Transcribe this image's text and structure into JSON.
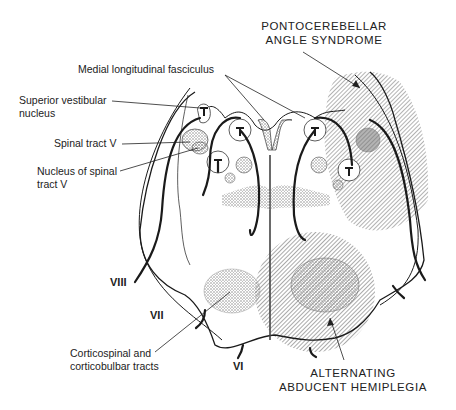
{
  "figure": {
    "type": "anatomical cross-section of lower pons",
    "syndromes": [
      {
        "label_line1": "PONTOCEREBELLAR",
        "label_line2": "ANGLE SYNDROME"
      },
      {
        "label_line1": "ALTERNATING",
        "label_line2": "ABDUCENT HEMIPLEGIA"
      }
    ],
    "structures": {
      "mlf": "Medial longitudinal fasciculus",
      "sup_vest_line1": "Superior vestibular",
      "sup_vest_line2": "nucleus",
      "spinal_tract": "Spinal tract V",
      "nuc_spinal_line1": "Nucleus of spinal",
      "nuc_spinal_line2": "tract V",
      "cortico_line1": "Corticospinal and",
      "cortico_line2": "corticobulbar tracts"
    },
    "nerves": {
      "n8": "VIII",
      "n7": "VII",
      "n6": "VI"
    },
    "colors": {
      "ink": "#1a1a1a",
      "hatch": "#555555",
      "stipple": "#888888"
    }
  }
}
